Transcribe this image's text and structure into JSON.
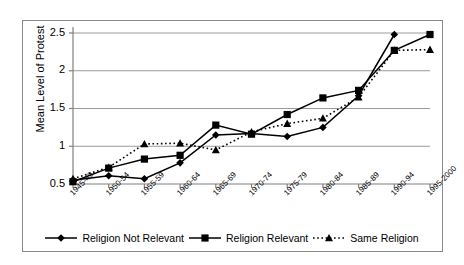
{
  "chart_data": {
    "type": "line",
    "title": "",
    "xlabel": "",
    "ylabel": "Mean Level of Protest",
    "ylim": [
      0.5,
      2.5
    ],
    "yticks": [
      "0.5",
      "1",
      "1.5",
      "2",
      "2.5"
    ],
    "ytick_values": [
      0.5,
      1,
      1.5,
      2,
      2.5
    ],
    "grid": true,
    "legend_position": "bottom",
    "categories": [
      "1945-49",
      "1950-54",
      "1955-59",
      "1960-64",
      "1965-69",
      "1970-74",
      "1975-79",
      "1980-84",
      "1985-89",
      "1990-94",
      "1995-2000"
    ],
    "series": [
      {
        "name": "Religion Not Relevant",
        "marker": "diamond",
        "line_style": "solid",
        "color": "#000000",
        "values": [
          0.55,
          0.61,
          0.57,
          0.78,
          1.15,
          1.17,
          1.13,
          1.25,
          1.67,
          2.48,
          null
        ]
      },
      {
        "name": "Religion Relevant",
        "marker": "square",
        "line_style": "solid",
        "color": "#000000",
        "values": [
          0.53,
          0.71,
          0.83,
          0.88,
          1.28,
          1.16,
          1.42,
          1.64,
          1.74,
          2.27,
          2.48
        ]
      },
      {
        "name": "Same Religion",
        "marker": "triangle",
        "line_style": "dotted",
        "color": "#000000",
        "values": [
          0.57,
          0.72,
          1.03,
          1.04,
          0.95,
          1.19,
          1.3,
          1.37,
          1.65,
          2.27,
          2.28
        ]
      }
    ]
  },
  "figure": {
    "border_color": "#8a8a8a",
    "background": "#ffffff",
    "gridline_color": "#9a9a9a",
    "axis_color": "#808080"
  }
}
